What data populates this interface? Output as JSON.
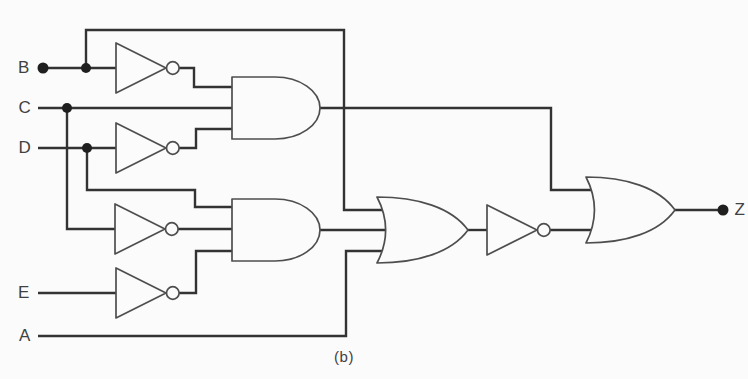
{
  "figure": {
    "background": "#fbfbfb",
    "wire_color": "#333333",
    "gate_color": "#4e4e4e",
    "dot_color": "#1f1f1f",
    "text_color": "#414141",
    "wire_width": 2.4,
    "gate_stroke_width": 1.7
  },
  "labels": {
    "input_b": "B",
    "input_c": "C",
    "input_d": "D",
    "input_e": "E",
    "input_a": "A",
    "output_z": "Z",
    "caption": "(b)"
  },
  "circuit": {
    "gates": [
      {
        "id": "not-gate-b",
        "type": "not",
        "x": 116,
        "y": 43,
        "w": 50,
        "h": 50
      },
      {
        "id": "not-gate-d",
        "type": "not",
        "x": 116,
        "y": 123,
        "w": 50,
        "h": 50
      },
      {
        "id": "not-gate-c",
        "type": "not",
        "x": 115,
        "y": 204,
        "w": 50,
        "h": 50
      },
      {
        "id": "not-gate-e",
        "type": "not",
        "x": 116,
        "y": 268,
        "w": 50,
        "h": 50
      },
      {
        "id": "and-gate-1",
        "type": "and",
        "x": 232,
        "y": 77,
        "w": 88,
        "h": 62
      },
      {
        "id": "and-gate-2",
        "type": "and",
        "x": 232,
        "y": 199,
        "w": 88,
        "h": 62
      },
      {
        "id": "or-gate-1",
        "type": "or",
        "x": 377,
        "y": 197,
        "w": 91,
        "h": 66
      },
      {
        "id": "not-gate-5",
        "type": "not",
        "x": 487,
        "y": 205,
        "w": 50,
        "h": 50
      },
      {
        "id": "or-gate-2",
        "type": "or",
        "x": 586,
        "y": 177,
        "w": 89,
        "h": 66
      }
    ],
    "wires": [
      {
        "id": "wire-b-input",
        "points": [
          [
            43,
            68
          ],
          [
            116,
            68
          ]
        ]
      },
      {
        "id": "wire-b-branch-top",
        "points": [
          [
            86,
            68
          ],
          [
            86,
            30
          ],
          [
            344,
            30
          ],
          [
            344,
            210
          ],
          [
            386,
            210
          ]
        ]
      },
      {
        "id": "wire-not-b-to-and1",
        "points": [
          [
            179,
            68
          ],
          [
            194,
            68
          ],
          [
            194,
            87
          ],
          [
            232,
            87
          ]
        ]
      },
      {
        "id": "wire-c-input",
        "points": [
          [
            38,
            108
          ],
          [
            232,
            108
          ]
        ]
      },
      {
        "id": "wire-c-branch",
        "points": [
          [
            67,
            108
          ],
          [
            67,
            229
          ],
          [
            115,
            229
          ]
        ]
      },
      {
        "id": "wire-d-input",
        "points": [
          [
            38,
            148
          ],
          [
            116,
            148
          ]
        ]
      },
      {
        "id": "wire-d-branch",
        "points": [
          [
            87,
            148
          ],
          [
            87,
            190
          ],
          [
            195,
            190
          ],
          [
            195,
            207
          ],
          [
            232,
            207
          ]
        ]
      },
      {
        "id": "wire-not-d-to-and1",
        "points": [
          [
            179,
            148
          ],
          [
            196,
            148
          ],
          [
            196,
            129
          ],
          [
            232,
            129
          ]
        ]
      },
      {
        "id": "wire-not-c-to-and2",
        "points": [
          [
            178,
            229
          ],
          [
            232,
            229
          ]
        ]
      },
      {
        "id": "wire-e-input",
        "points": [
          [
            38,
            293
          ],
          [
            116,
            293
          ]
        ]
      },
      {
        "id": "wire-not-e-to-and2",
        "points": [
          [
            179,
            293
          ],
          [
            196,
            293
          ],
          [
            196,
            251
          ],
          [
            232,
            251
          ]
        ]
      },
      {
        "id": "wire-and1-out",
        "points": [
          [
            320,
            108
          ],
          [
            551,
            108
          ],
          [
            551,
            190
          ],
          [
            594,
            190
          ]
        ]
      },
      {
        "id": "wire-and2-out",
        "points": [
          [
            320,
            230
          ],
          [
            388,
            230
          ]
        ]
      },
      {
        "id": "wire-a-input",
        "points": [
          [
            38,
            336
          ],
          [
            346,
            336
          ],
          [
            346,
            251
          ],
          [
            386,
            251
          ]
        ]
      },
      {
        "id": "wire-or1-to-not5",
        "points": [
          [
            468,
            230
          ],
          [
            487,
            230
          ]
        ]
      },
      {
        "id": "wire-not5-out",
        "points": [
          [
            550,
            230
          ],
          [
            596,
            230
          ]
        ]
      },
      {
        "id": "wire-or2-out",
        "points": [
          [
            675,
            210
          ],
          [
            723,
            210
          ]
        ]
      }
    ],
    "junctions": [
      {
        "id": "junction-b",
        "x": 86,
        "y": 68
      },
      {
        "id": "junction-c",
        "x": 67,
        "y": 108
      },
      {
        "id": "junction-d",
        "x": 87,
        "y": 148
      }
    ],
    "terminals": [
      {
        "id": "terminal-b",
        "x": 43,
        "y": 68
      },
      {
        "id": "terminal-z",
        "x": 723,
        "y": 210
      }
    ]
  }
}
